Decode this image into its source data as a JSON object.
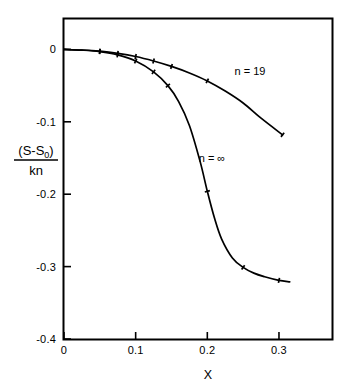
{
  "chart_data": {
    "type": "line",
    "title": "",
    "subtitle": "",
    "xlabel": "X",
    "ylabel_numerator": "(S-S",
    "ylabel_numerator_sub": "0",
    "ylabel_numerator_close": ")",
    "ylabel_denominator": "kn",
    "ylabel_plain": "(S-S0)/kn",
    "xlim": [
      0.0,
      0.374
    ],
    "ylim": [
      -0.4,
      0.042
    ],
    "xticks": [
      0,
      0.1,
      0.2,
      0.3
    ],
    "xtick_labels": [
      "0",
      "0.1",
      "0.2",
      "0.3"
    ],
    "yticks": [
      0,
      -0.1,
      -0.2,
      -0.3,
      -0.4
    ],
    "ytick_labels": [
      "0",
      "-0.1",
      "-0.2",
      "-0.3",
      "-0.4"
    ],
    "grid": false,
    "legend_position": "inline-annotation",
    "line_color": "#000000",
    "frame_color": "#000000",
    "background_color": "#ffffff",
    "series": [
      {
        "name": "n = 19",
        "label": "n = 19",
        "label_x": 0.238,
        "label_y": -0.036,
        "marker": "tick",
        "x": [
          0.0,
          0.025,
          0.05,
          0.075,
          0.1,
          0.125,
          0.15,
          0.175,
          0.2,
          0.225,
          0.25,
          0.275,
          0.305
        ],
        "y": [
          0.0,
          -0.0008,
          -0.0025,
          -0.0055,
          -0.0098,
          -0.016,
          -0.0235,
          -0.0325,
          -0.0435,
          -0.0575,
          -0.074,
          -0.095,
          -0.118
        ],
        "marker_x": [
          0.05,
          0.075,
          0.1,
          0.125,
          0.15,
          0.2,
          0.305
        ],
        "marker_y": [
          -0.0025,
          -0.0055,
          -0.0098,
          -0.016,
          -0.0235,
          -0.0435,
          -0.118
        ]
      },
      {
        "name": "n = ∞",
        "label": "n = ∞",
        "label_x": 0.188,
        "label_y": -0.155,
        "marker": "tick",
        "x": [
          0.0,
          0.025,
          0.05,
          0.075,
          0.1,
          0.125,
          0.145,
          0.16,
          0.175,
          0.19,
          0.2,
          0.21,
          0.22,
          0.235,
          0.25,
          0.265,
          0.28,
          0.3,
          0.315
        ],
        "y": [
          0.0,
          -0.001,
          -0.003,
          -0.0075,
          -0.016,
          -0.031,
          -0.05,
          -0.072,
          -0.105,
          -0.155,
          -0.196,
          -0.233,
          -0.262,
          -0.288,
          -0.301,
          -0.309,
          -0.314,
          -0.319,
          -0.321
        ],
        "marker_x": [
          0.05,
          0.075,
          0.1,
          0.125,
          0.145,
          0.2,
          0.25,
          0.3
        ],
        "marker_y": [
          -0.003,
          -0.0075,
          -0.016,
          -0.031,
          -0.05,
          -0.196,
          -0.301,
          -0.319
        ]
      }
    ]
  },
  "figure": {
    "xlabel": "X",
    "ylabel_numerator": "(S-S",
    "ylabel_numerator_sub": "0",
    "ylabel_numerator_close": ")",
    "ylabel_denominator": "kn",
    "xtick_0": "0",
    "xtick_1": "0.1",
    "xtick_2": "0.2",
    "xtick_3": "0.3",
    "ytick_0": "0",
    "ytick_1": "-0.1",
    "ytick_2": "-0.2",
    "ytick_3": "-0.3",
    "ytick_4": "-0.4",
    "series_label_0": "n = 19",
    "series_label_1": "n = ∞"
  }
}
